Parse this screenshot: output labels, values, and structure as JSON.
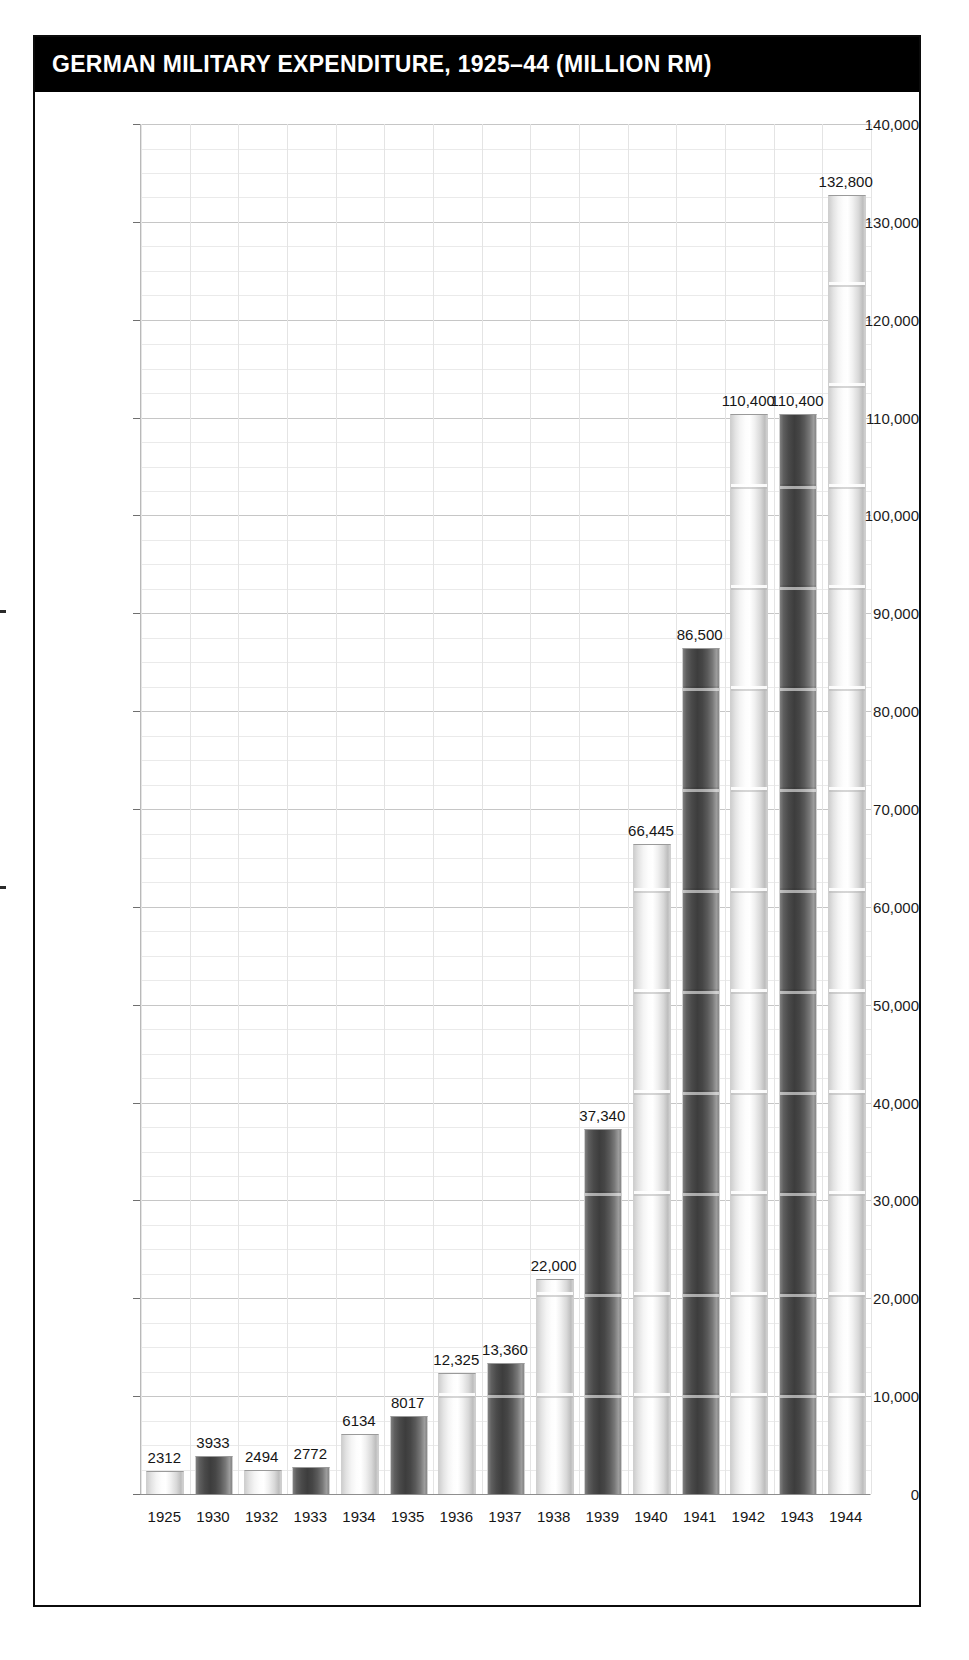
{
  "title": "GERMAN MILITARY EXPENDITURE, 1925–44 (MILLION RM)",
  "colors": {
    "title_bar_bg": "#000000",
    "title_text": "#ffffff",
    "panel_border": "#0b0b0b",
    "grid_major": "#c6c6c6",
    "grid_minor": "#eaeaea",
    "bar_light": "#f0f0f0",
    "bar_dark": "#4a4a4a",
    "text": "#161616"
  },
  "chart_data": {
    "type": "bar",
    "title": "GERMAN MILITARY EXPENDITURE, 1925–44 (MILLION RM)",
    "xlabel": "",
    "ylabel": "",
    "ylim": [
      0,
      140000
    ],
    "grid": true,
    "legend": "none",
    "unit": "Million RM",
    "y_tick_labels": [
      "140,000",
      "130,000",
      "120,000",
      "110,000",
      "100,000",
      "90,000",
      "80,000",
      "70,000",
      "60,000",
      "50,000",
      "40,000",
      "30,000",
      "20,000",
      "10,000",
      "0"
    ],
    "y_tick_values": [
      140000,
      130000,
      120000,
      110000,
      100000,
      90000,
      80000,
      70000,
      60000,
      50000,
      40000,
      30000,
      20000,
      10000,
      0
    ],
    "y_minor_step": 2500,
    "categories": [
      "1925",
      "1930",
      "1932",
      "1933",
      "1934",
      "1935",
      "1936",
      "1937",
      "1938",
      "1939",
      "1940",
      "1941",
      "1942",
      "1943",
      "1944"
    ],
    "values": [
      2312,
      3933,
      2494,
      2772,
      6134,
      8017,
      12325,
      13360,
      22000,
      37340,
      66445,
      86500,
      110400,
      110400,
      132800
    ],
    "value_labels": [
      "2312",
      "3933",
      "2494",
      "2772",
      "6134",
      "8017",
      "12,325",
      "13,360",
      "22,000",
      "37,340",
      "66,445",
      "86,500",
      "110,400",
      "110,400",
      "132,800"
    ],
    "bar_styles": [
      "light",
      "dark",
      "light",
      "dark",
      "light",
      "dark",
      "light",
      "dark",
      "light",
      "dark",
      "light",
      "dark",
      "light",
      "dark",
      "light"
    ]
  }
}
